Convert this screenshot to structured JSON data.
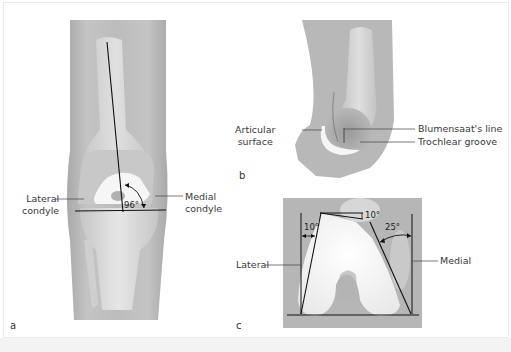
{
  "figure": {
    "panels": [
      {
        "id": "a",
        "letter": "a",
        "description": "Anterior view of knee showing femoral axis and joint line angle",
        "labels": {
          "lateral_line1": "Lateral",
          "lateral_line2": "condyle",
          "medial_line1": "Medial",
          "medial_line2": "condyle",
          "angle": "96°"
        }
      },
      {
        "id": "b",
        "letter": "b",
        "description": "Lateral view of distal femur",
        "labels": {
          "articular_line1": "Articular",
          "articular_line2": "surface",
          "blumensaat": "Blumensaat's line",
          "trochlear": "Trochlear groove"
        }
      },
      {
        "id": "c",
        "letter": "c",
        "description": "Axial (notch) view of femoral condyles with angles",
        "labels": {
          "lateral": "Lateral",
          "medial": "Medial",
          "angle_lateral": "10°",
          "angle_top": "10°",
          "angle_medial": "25°"
        }
      }
    ]
  },
  "colors": {
    "tissue": "#b9b9b9",
    "bone": "#d6d6d6",
    "cartilage": "#f7f7f7",
    "line": "#111111",
    "text": "#3a3a3a"
  }
}
